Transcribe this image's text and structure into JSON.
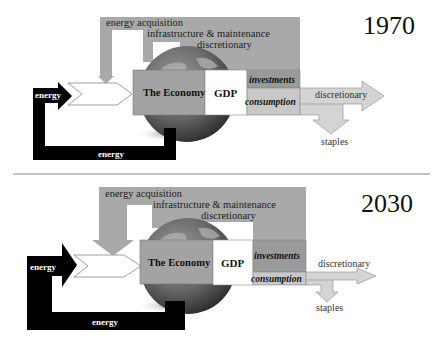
{
  "panels": [
    {
      "year": "1970",
      "energy_acquisition": "energy acquisition",
      "infrastructure": "infrastructure & maintenance",
      "discretionary_top": "discretionary",
      "economy": "The Economy",
      "gdp": "GDP",
      "investments": "investments",
      "consumption": "consumption",
      "discretionary_out": "discretionary",
      "staples": "staples",
      "energy_in": "energy",
      "energy_loop": "energy"
    },
    {
      "year": "2030",
      "energy_acquisition": "energy acquisition",
      "infrastructure": "infrastructure & maintenance",
      "discretionary_top": "discretionary",
      "economy": "The Economy",
      "gdp": "GDP",
      "investments": "investments",
      "consumption": "consumption",
      "discretionary_out": "discretionary",
      "staples": "staples",
      "energy_in": "energy",
      "energy_loop": "energy"
    }
  ],
  "colors": {
    "band": "#a9a9a9",
    "economy": "#a3a3a3",
    "investments": "#9a9a9a",
    "consumption": "#c8c8c8",
    "arrow_fill": "#d4d4d4",
    "energy": "#000000",
    "divider": "#8a8a8a"
  }
}
